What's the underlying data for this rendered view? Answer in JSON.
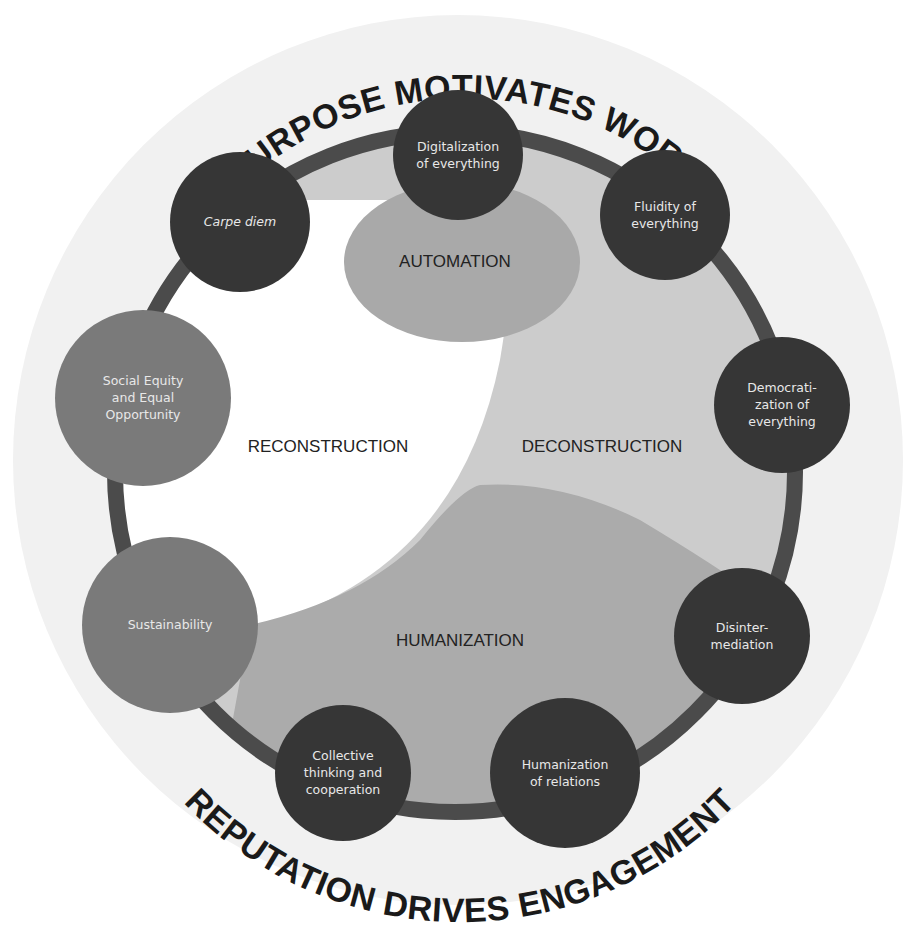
{
  "titles": {
    "top": "PURPOSE MOTIVATES WORK",
    "bottom": "REPUTATION DRIVES ENGAGEMENT"
  },
  "zones": {
    "automation": "AUTOMATION",
    "reconstruction": "RECONSTRUCTION",
    "deconstruction": "DECONSTRUCTION",
    "humanization": "HUMANIZATION"
  },
  "nodes": [
    {
      "id": "digitalization",
      "lines": [
        "Digitalization",
        "of everything"
      ],
      "cx": 458,
      "cy": 155,
      "r": 65,
      "shade": "dark",
      "italic": false
    },
    {
      "id": "fluidity",
      "lines": [
        "Fluidity of",
        "everything"
      ],
      "cx": 665,
      "cy": 215,
      "r": 65,
      "shade": "dark",
      "italic": false
    },
    {
      "id": "democratization",
      "lines": [
        "Democrati-",
        "zation of",
        "everything"
      ],
      "cx": 782,
      "cy": 405,
      "r": 68,
      "shade": "dark",
      "italic": false
    },
    {
      "id": "disintermediation",
      "lines": [
        "Disinter-",
        "mediation"
      ],
      "cx": 742,
      "cy": 636,
      "r": 68,
      "shade": "dark",
      "italic": false
    },
    {
      "id": "humanization-relations",
      "lines": [
        "Humanization",
        "of relations"
      ],
      "cx": 565,
      "cy": 773,
      "r": 75,
      "shade": "dark",
      "italic": false
    },
    {
      "id": "collective-thinking",
      "lines": [
        "Collective",
        "thinking and",
        "cooperation"
      ],
      "cx": 343,
      "cy": 773,
      "r": 68,
      "shade": "dark",
      "italic": false
    },
    {
      "id": "sustainability",
      "lines": [
        "Sustainability"
      ],
      "cx": 170,
      "cy": 625,
      "r": 88,
      "shade": "mid",
      "italic": false
    },
    {
      "id": "social-equity",
      "lines": [
        "Social Equity",
        "and Equal",
        "Opportunity"
      ],
      "cx": 143,
      "cy": 398,
      "r": 88,
      "shade": "mid",
      "italic": false
    },
    {
      "id": "carpe-diem",
      "lines": [
        "Carpe diem"
      ],
      "cx": 240,
      "cy": 222,
      "r": 70,
      "shade": "dark",
      "italic": true
    }
  ],
  "colors": {
    "background": "#ffffff",
    "outer_disc": "#f1f1f1",
    "ring_track": "#4b4b4b",
    "node_dark": "#363636",
    "node_mid": "#7a7a7a",
    "deconstruction_fill": "#cccccc",
    "blob_fill": "#a9a9a9",
    "reconstruction_fill": "#ffffff",
    "title_text": "#1a1a1a",
    "node_text": "#e8e8e8"
  }
}
